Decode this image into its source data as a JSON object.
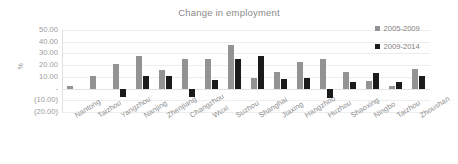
{
  "chart_data": {
    "type": "bar",
    "title": "Change in employment",
    "xlabel": "",
    "ylabel": "%",
    "grid": true,
    "legend_position": "top-right",
    "ylim": [
      -20,
      50
    ],
    "ytick_labels": [
      "50.00",
      "40.00",
      "30.00",
      "20.00",
      "10.00",
      "-",
      "(10.00)",
      "(20.00)"
    ],
    "ytick_values": [
      50,
      40,
      30,
      20,
      10,
      0,
      -10,
      -20
    ],
    "categories": [
      "Nantong",
      "Taizhou",
      "Yangzhou",
      "Nanjing",
      "Zhenjiang",
      "Changzhou",
      "Wuxi",
      "Suzhou",
      "Shanghai",
      "Jiaxing",
      "Hangzhou",
      "Huzhou",
      "Shaoxing",
      "Ningbo",
      "Taizhou",
      "Zhoushan"
    ],
    "series": [
      {
        "name": "2005-2009",
        "color": "#939393",
        "values": [
          2.0,
          11.0,
          21.0,
          28.0,
          16.0,
          25.5,
          25.5,
          37.0,
          9.0,
          14.5,
          23.0,
          25.0,
          14.5,
          6.5,
          2.0,
          16.5
        ]
      },
      {
        "name": "2009-2014",
        "color": "#1b1b1b",
        "values": [
          0.0,
          0.0,
          -7.0,
          11.0,
          11.0,
          -7.0,
          7.5,
          25.5,
          27.5,
          8.0,
          9.0,
          -8.0,
          5.5,
          13.5,
          6.0,
          11.0
        ]
      }
    ]
  }
}
